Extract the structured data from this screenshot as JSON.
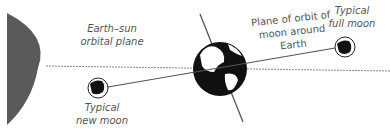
{
  "labels": {
    "earth_sun_plane": [
      "Earth–sun",
      "orbital plane"
    ],
    "moon_orbit_plane": [
      "Plane of orbit of",
      "moon around",
      "Earth"
    ],
    "full_moon": [
      "Typical",
      "full moon"
    ],
    "new_moon": [
      "Typical",
      "new moon"
    ]
  },
  "colors": {
    "sun": "#5a5a5a",
    "line": "#555555",
    "dashed": "#888888",
    "earth": "#111111",
    "text": "#555555"
  }
}
